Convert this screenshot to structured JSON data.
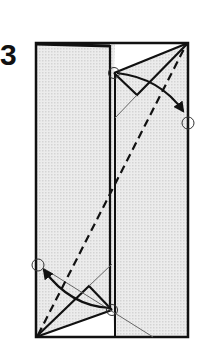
{
  "diagram": {
    "step_number": "3",
    "colors": {
      "paper_shaded": "#e4e4e4",
      "paper_white": "#ffffff",
      "line": "#111111",
      "thin_line": "#666666"
    },
    "symbols": [
      {
        "type": "valley-fold-line",
        "style": "dashed",
        "from": "bottom-left corner",
        "to": "top-right corner"
      },
      {
        "type": "fold-arrow",
        "location": "top-right",
        "direction": "down-right"
      },
      {
        "type": "fold-arrow",
        "location": "bottom-left",
        "direction": "up-left"
      },
      {
        "type": "reference-circle",
        "count": 4
      }
    ]
  }
}
